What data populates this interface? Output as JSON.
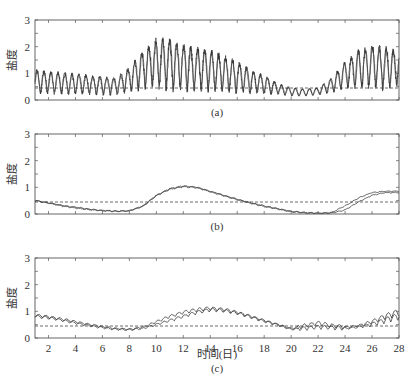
{
  "figure": {
    "ylabel": "盐度",
    "xlabel": "时间(日)",
    "panel_labels": [
      "(a)",
      "(b)",
      "(c)"
    ],
    "x_ticks": [
      2,
      4,
      6,
      8,
      10,
      12,
      14,
      16,
      18,
      20,
      22,
      24,
      26,
      28
    ],
    "y_ticks": [
      0,
      1,
      2,
      3
    ],
    "colors": {
      "line": "#333333",
      "frame": "#555555",
      "dashed": "#444444"
    }
  },
  "chart_data": [
    {
      "type": "line",
      "title": "(a)",
      "xlabel": "",
      "ylabel": "盐度",
      "xlim": [
        1,
        28
      ],
      "ylim": [
        0,
        3
      ],
      "grid": false,
      "threshold": 0.45,
      "description": "Strongly oscillating salinity (semi-diurnal), two series overlaid; envelope low ~0.1-1.1 days 1-7, peak ~2.2 near day 10-11, decaying to ~0.2-0.4 by days 19-22, rising again to ~1.9-2.0 days 25-28",
      "series": [
        {
          "name": "series-1 envelope-max",
          "x": [
            1,
            3,
            5,
            7,
            8,
            9,
            10,
            11,
            12,
            13,
            14,
            15,
            16,
            17,
            18,
            19,
            20,
            21,
            22,
            23,
            24,
            25,
            26,
            27,
            28
          ],
          "values": [
            1.1,
            1.0,
            0.9,
            0.8,
            1.2,
            1.8,
            2.2,
            2.2,
            2.0,
            1.9,
            1.8,
            1.6,
            1.4,
            1.1,
            0.9,
            0.6,
            0.45,
            0.4,
            0.45,
            0.8,
            1.4,
            1.8,
            2.0,
            1.9,
            1.8
          ]
        },
        {
          "name": "series-1 envelope-min",
          "x": [
            1,
            3,
            5,
            7,
            8,
            9,
            10,
            11,
            12,
            13,
            14,
            15,
            16,
            17,
            18,
            19,
            20,
            21,
            22,
            23,
            24,
            25,
            26,
            27,
            28
          ],
          "values": [
            0.1,
            0.1,
            0.1,
            0.1,
            0.2,
            0.2,
            0.2,
            0.15,
            0.1,
            0.1,
            0.1,
            0.1,
            0.1,
            0.1,
            0.1,
            0.15,
            0.1,
            0.1,
            0.15,
            0.2,
            0.3,
            0.2,
            0.2,
            0.2,
            0.3
          ]
        }
      ]
    },
    {
      "type": "line",
      "title": "(b)",
      "xlabel": "",
      "ylabel": "盐度",
      "xlim": [
        1,
        28
      ],
      "ylim": [
        0,
        3
      ],
      "grid": false,
      "threshold": 0.45,
      "series": [
        {
          "name": "series-1",
          "x": [
            1,
            2,
            3,
            4,
            5,
            6,
            7,
            8,
            9,
            10,
            11,
            12,
            13,
            14,
            15,
            16,
            17,
            18,
            19,
            20,
            21,
            22,
            23,
            24,
            25,
            26,
            27,
            28
          ],
          "values": [
            0.5,
            0.42,
            0.32,
            0.25,
            0.18,
            0.13,
            0.1,
            0.12,
            0.3,
            0.7,
            0.95,
            1.05,
            1.0,
            0.85,
            0.7,
            0.55,
            0.42,
            0.3,
            0.2,
            0.1,
            0.05,
            0.03,
            0.05,
            0.3,
            0.6,
            0.8,
            0.85,
            0.85
          ]
        },
        {
          "name": "series-2",
          "x": [
            1,
            2,
            3,
            4,
            5,
            6,
            7,
            8,
            9,
            10,
            11,
            12,
            13,
            14,
            15,
            16,
            17,
            18,
            19,
            20,
            21,
            22,
            23,
            24,
            25,
            26,
            27,
            28
          ],
          "values": [
            0.5,
            0.4,
            0.3,
            0.22,
            0.16,
            0.12,
            0.1,
            0.11,
            0.28,
            0.68,
            0.92,
            1.02,
            0.98,
            0.83,
            0.68,
            0.53,
            0.4,
            0.28,
            0.18,
            0.08,
            0.04,
            0.02,
            0.03,
            0.15,
            0.45,
            0.7,
            0.8,
            0.8
          ]
        }
      ]
    },
    {
      "type": "line",
      "title": "(c)",
      "xlabel": "时间(日)",
      "ylabel": "盐度",
      "xlim": [
        1,
        28
      ],
      "ylim": [
        0,
        3
      ],
      "grid": false,
      "threshold": 0.45,
      "series": [
        {
          "name": "series-1",
          "x": [
            1,
            2,
            3,
            4,
            5,
            6,
            7,
            8,
            9,
            10,
            11,
            12,
            13,
            14,
            15,
            16,
            17,
            18,
            19,
            20,
            21,
            22,
            23,
            24,
            25,
            26,
            27,
            28
          ],
          "values": [
            0.85,
            0.78,
            0.7,
            0.6,
            0.5,
            0.42,
            0.35,
            0.32,
            0.4,
            0.6,
            0.8,
            0.95,
            1.05,
            1.1,
            1.05,
            0.95,
            0.8,
            0.65,
            0.5,
            0.35,
            0.45,
            0.55,
            0.45,
            0.4,
            0.45,
            0.6,
            0.8,
            0.95
          ]
        },
        {
          "name": "series-2",
          "x": [
            1,
            2,
            3,
            4,
            5,
            6,
            7,
            8,
            9,
            10,
            11,
            12,
            13,
            14,
            15,
            16,
            17,
            18,
            19,
            20,
            21,
            22,
            23,
            24,
            25,
            26,
            27,
            28
          ],
          "values": [
            0.8,
            0.75,
            0.66,
            0.55,
            0.46,
            0.38,
            0.32,
            0.3,
            0.35,
            0.5,
            0.65,
            0.8,
            0.95,
            1.05,
            1.02,
            0.92,
            0.78,
            0.62,
            0.48,
            0.32,
            0.35,
            0.4,
            0.38,
            0.35,
            0.4,
            0.5,
            0.65,
            0.8
          ]
        }
      ]
    }
  ]
}
